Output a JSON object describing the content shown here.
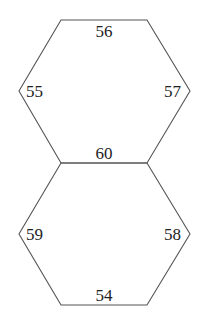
{
  "diagram": {
    "type": "two-stacked-hexagons",
    "stroke_color": "#555555",
    "text_color": "#222222",
    "hexagons": [
      {
        "name": "upper",
        "vertices": [
          [
            61,
            20
          ],
          [
            147,
            20
          ],
          [
            190,
            91
          ],
          [
            147,
            163
          ],
          [
            61,
            163
          ],
          [
            19,
            91
          ]
        ],
        "edge_labels": {
          "top": "56",
          "upper_left": "55",
          "upper_right": "57",
          "bottom": "60"
        }
      },
      {
        "name": "lower",
        "vertices": [
          [
            61,
            163
          ],
          [
            147,
            163
          ],
          [
            190,
            234
          ],
          [
            147,
            305
          ],
          [
            61,
            305
          ],
          [
            19,
            234
          ]
        ],
        "edge_labels": {
          "top": "60",
          "left": "59",
          "right": "58",
          "bottom": "54"
        }
      }
    ],
    "labels": [
      {
        "id": "l56",
        "text": "56",
        "x": 104,
        "y": 37
      },
      {
        "id": "l55",
        "text": "55",
        "x": 26,
        "y": 97
      },
      {
        "id": "l57",
        "text": "57",
        "x": 181,
        "y": 97
      },
      {
        "id": "l60",
        "text": "60",
        "x": 104,
        "y": 159
      },
      {
        "id": "l59",
        "text": "59",
        "x": 26,
        "y": 240
      },
      {
        "id": "l58",
        "text": "58",
        "x": 181,
        "y": 240
      },
      {
        "id": "l54",
        "text": "54",
        "x": 104,
        "y": 301
      }
    ]
  }
}
